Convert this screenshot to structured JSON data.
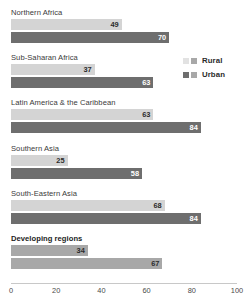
{
  "chart_data": {
    "type": "bar",
    "orientation": "horizontal",
    "title": "",
    "xlabel": "",
    "ylabel": "",
    "xlim": [
      0,
      100
    ],
    "xticks": [
      "0",
      "20",
      "40",
      "60",
      "80",
      "100"
    ],
    "grid": false,
    "legend_position": "right",
    "categories": [
      "Northern Africa",
      "Sub-Saharan Africa",
      "Latin America & the Caribbean",
      "Southern Asia",
      "South-Eastern Asia",
      "Developing regions"
    ],
    "series": [
      {
        "name": "Rural",
        "values": [
          49,
          37,
          63,
          25,
          68,
          34
        ]
      },
      {
        "name": "Urban",
        "values": [
          70,
          63,
          84,
          58,
          84,
          67
        ]
      }
    ],
    "groups": [
      {
        "label": "Northern Africa",
        "highlight": false,
        "bars": [
          {
            "series": "Rural",
            "value": 49,
            "style": "rural"
          },
          {
            "series": "Urban",
            "value": 70,
            "style": "urban"
          }
        ]
      },
      {
        "label": "Sub-Saharan Africa",
        "highlight": false,
        "bars": [
          {
            "series": "Rural",
            "value": 37,
            "style": "rural"
          },
          {
            "series": "Urban",
            "value": 63,
            "style": "urban"
          }
        ]
      },
      {
        "label": "Latin America & the Caribbean",
        "highlight": false,
        "bars": [
          {
            "series": "Rural",
            "value": 63,
            "style": "rural"
          },
          {
            "series": "Urban",
            "value": 84,
            "style": "urban"
          }
        ]
      },
      {
        "label": "Southern Asia",
        "highlight": false,
        "bars": [
          {
            "series": "Rural",
            "value": 25,
            "style": "rural"
          },
          {
            "series": "Urban",
            "value": 58,
            "style": "urban"
          }
        ]
      },
      {
        "label": "South-Eastern Asia",
        "highlight": false,
        "bars": [
          {
            "series": "Rural",
            "value": 68,
            "style": "rural"
          },
          {
            "series": "Urban",
            "value": 84,
            "style": "urban"
          }
        ]
      },
      {
        "label": "Developing regions",
        "highlight": true,
        "bars": [
          {
            "series": "Rural",
            "value": 34,
            "style": "summary"
          },
          {
            "series": "Urban",
            "value": 67,
            "style": "summary"
          }
        ]
      }
    ],
    "legend": [
      {
        "label": "Rural",
        "swatches": [
          "#e2e2e2",
          "#a8a8a8"
        ]
      },
      {
        "label": "Urban",
        "swatches": [
          "#6e6e6e",
          "#a8a8a8"
        ]
      }
    ],
    "colors": {
      "rural": "#d4d4d4",
      "urban": "#6e6e6e",
      "summary": "#a8a8a8",
      "axis": "#c8c8c8",
      "text": "#3a3a3a",
      "background": "#ffffff"
    }
  }
}
